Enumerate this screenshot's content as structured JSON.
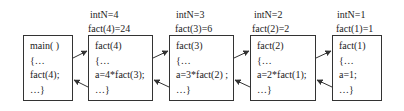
{
  "diagram": {
    "type": "recursion-call-stack",
    "frames": [
      {
        "id": "main",
        "labels": [],
        "lines": [
          "main( )",
          "{…",
          "fact(4);",
          "…}"
        ]
      },
      {
        "id": "fact4",
        "labels": [
          "intN=4",
          "fact(4)=24"
        ],
        "lines": [
          "fact(4)",
          "{…",
          "a=4*fact(3);",
          "…}"
        ]
      },
      {
        "id": "fact3",
        "labels": [
          "intN=3",
          "fact(3)=6"
        ],
        "lines": [
          "fact(3)",
          "{…",
          "a=3*fact(2) ;",
          "…}"
        ]
      },
      {
        "id": "fact2",
        "labels": [
          "intN=2",
          "fact(2)=2"
        ],
        "lines": [
          "fact(2)",
          "{…",
          "a=2*fact(1);",
          "…}"
        ]
      },
      {
        "id": "fact1",
        "labels": [
          "intN=1",
          "fact(1)=1"
        ],
        "lines": [
          "fact(1)",
          "{…",
          "a=1;",
          "…}"
        ]
      }
    ],
    "edges": [
      {
        "from": "main",
        "to": "fact4",
        "kind": "call"
      },
      {
        "from": "fact4",
        "to": "main",
        "kind": "return"
      },
      {
        "from": "fact4",
        "to": "fact3",
        "kind": "call"
      },
      {
        "from": "fact3",
        "to": "fact4",
        "kind": "return"
      },
      {
        "from": "fact3",
        "to": "fact2",
        "kind": "call"
      },
      {
        "from": "fact2",
        "to": "fact3",
        "kind": "return"
      },
      {
        "from": "fact2",
        "to": "fact1",
        "kind": "call"
      },
      {
        "from": "fact1",
        "to": "fact2",
        "kind": "return"
      }
    ],
    "colors": {
      "stroke": "#333333",
      "text": "#222222",
      "background": "#ffffff"
    }
  }
}
